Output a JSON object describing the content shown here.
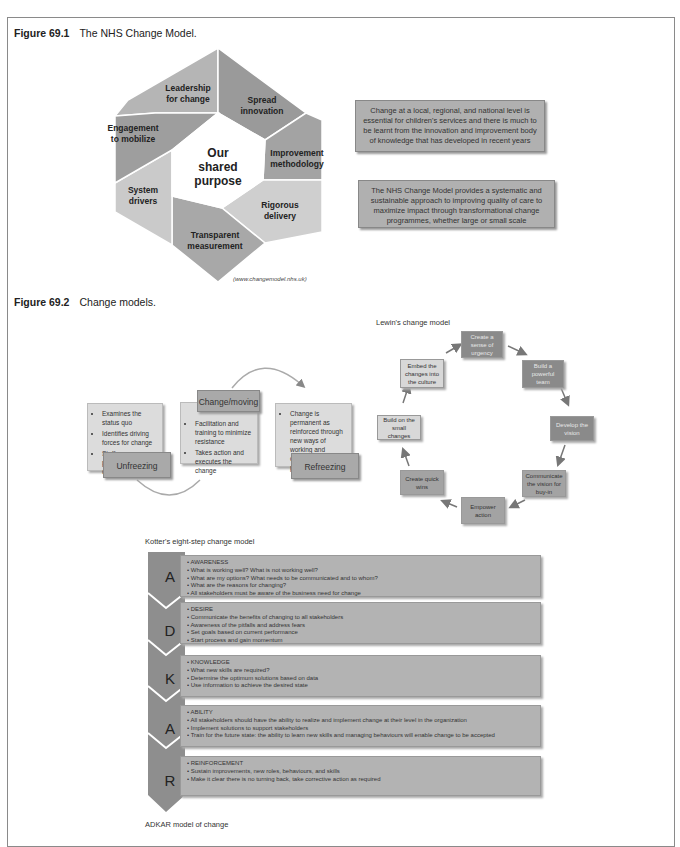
{
  "figure1": {
    "number": "Figure 69.1",
    "caption": "The NHS Change Model.",
    "center": [
      "Our",
      "shared",
      "purpose"
    ],
    "segments": [
      {
        "label": [
          "Leadership",
          "for change"
        ],
        "color": "#b5b5b5"
      },
      {
        "label": [
          "Spread",
          "innovation"
        ],
        "color": "#9a9a9a"
      },
      {
        "label": [
          "Improvement",
          "methodology"
        ],
        "color": "#a3a3a3"
      },
      {
        "label": [
          "Rigorous",
          "delivery"
        ],
        "color": "#cfcfcf"
      },
      {
        "label": [
          "Transparent",
          "measurement"
        ],
        "color": "#a8a8a8"
      },
      {
        "label": [
          "System",
          "drivers"
        ],
        "color": "#cacaca"
      },
      {
        "label": [
          "Engagement",
          "to mobilize"
        ],
        "color": "#9e9e9e"
      }
    ],
    "credit": "(www.changemodel.nhs.uk)",
    "box1": "Change at a local, regional, and national level is essential for children's services and there is much to be learnt from the innovation and improvement body of knowledge that has developed in recent years",
    "box2": "The NHS Change Model provides a systematic and sustainable approach to improving quality of care to maximize impact through transformational change programmes, whether large or small scale"
  },
  "figure2": {
    "number": "Figure 69.2",
    "caption": "Change models.",
    "lewin": {
      "stages": [
        {
          "name": "Unfreezing",
          "bullets": [
            "Examines the status quo",
            "Identifies driving forces for change",
            "Staff preparedness for change"
          ]
        },
        {
          "name": "Change/moving",
          "bullets": [
            "Facilitation and training to minimize resistance",
            "Takes action and executes the change"
          ]
        },
        {
          "name": "Refreezing",
          "bullets": [
            "Change is permanent as reinforced through new ways of working and operating procedures"
          ]
        }
      ]
    },
    "kotter": {
      "title": "Lewin's change model",
      "steps": [
        "Create a sense of urgency",
        "Build a powerful team",
        "Develop the vision",
        "Communicate the vision for buy-in",
        "Empower action",
        "Create quick wins",
        "Build on the small changes",
        "Embed the changes into the culture"
      ]
    },
    "kotter_caption": "Kotter's eight-step change model",
    "adkar": {
      "rows": [
        {
          "letter": "A",
          "lines": [
            "• AWARENESS",
            "• What is working well? What is not working well?",
            "• What are my options? What needs to be communicated and to whom?",
            "• What are the reasons for changing?",
            "• All stakeholders must be aware of the business need for change"
          ]
        },
        {
          "letter": "D",
          "lines": [
            "• DESIRE",
            "• Communicate the benefits of changing to all stakeholders",
            "• Awareness of the pitfalls and address fears",
            "• Set goals based on current performance",
            "• Start process and gain momentum"
          ]
        },
        {
          "letter": "K",
          "lines": [
            "• KNOWLEDGE",
            "• What new skills are required?",
            "• Determine the optimum solutions based on data",
            "• Use information to achieve the desired state"
          ]
        },
        {
          "letter": "A",
          "lines": [
            "• ABILITY",
            "• All stakeholders should have the ability to realize and implement change at their level in the organization",
            "• Implement solutions to support stakeholders",
            "• Train for the future state: the ability to learn new skills and managing behaviours will enable change to be accepted"
          ]
        },
        {
          "letter": "R",
          "lines": [
            "• REINFORCEMENT",
            "• Sustain improvements, new roles, behaviours, and skills",
            "• Make it clear there is no turning back, take corrective action as required"
          ]
        }
      ],
      "caption": "ADKAR model of change"
    }
  }
}
